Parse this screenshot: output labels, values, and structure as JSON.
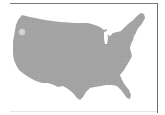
{
  "map": {
    "region": "contiguous-united-states",
    "fill_color": "#a3a3a3",
    "background_color": "#ffffff",
    "marker": {
      "location": "Washington (Pacific Northwest)",
      "color": "#d4d4d4"
    }
  },
  "frame": {
    "line_color": "#7a7a7a"
  }
}
